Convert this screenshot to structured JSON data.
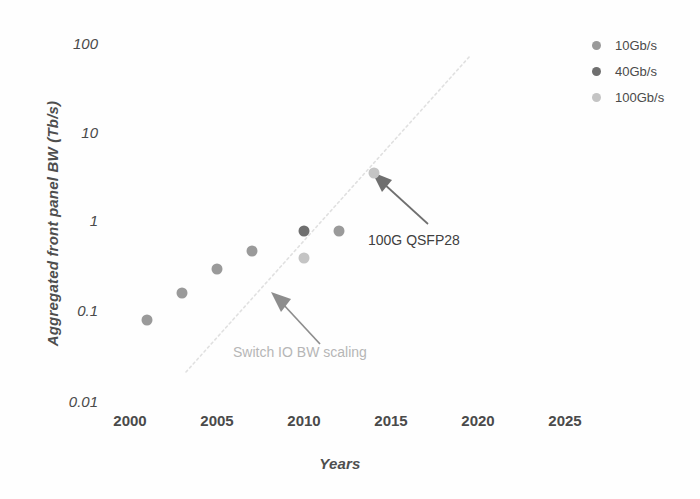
{
  "chart_data": {
    "type": "scatter",
    "title": "",
    "xlabel": "Years",
    "ylabel": "Aggregated front panel BW (Tb/s)",
    "yscale": "log",
    "ylim": [
      0.01,
      100
    ],
    "xlim": [
      2000,
      2025
    ],
    "grid": false,
    "legend_position": "top-right",
    "xticks": [
      "2000",
      "2005",
      "2010",
      "2015",
      "2020",
      "2025"
    ],
    "xtick_values": [
      2000,
      2005,
      2010,
      2015,
      2020,
      2025
    ],
    "yticks": [
      "100",
      "10",
      "1",
      "0.1",
      "0.01"
    ],
    "ytick_values": [
      100,
      10,
      1,
      0.1,
      0.01
    ],
    "series": [
      {
        "name": "10Gb/s",
        "color": "#9a9a9a",
        "points": [
          {
            "x": 2001,
            "y": 0.08
          },
          {
            "x": 2003,
            "y": 0.16
          },
          {
            "x": 2005,
            "y": 0.3
          },
          {
            "x": 2007,
            "y": 0.47
          },
          {
            "x": 2012,
            "y": 0.8
          }
        ]
      },
      {
        "name": "40Gb/s",
        "color": "#6f6f6f",
        "points": [
          {
            "x": 2010,
            "y": 0.8
          }
        ]
      },
      {
        "name": "100Gb/s",
        "color": "#c4c4c4",
        "points": [
          {
            "x": 2010,
            "y": 0.4
          },
          {
            "x": 2014,
            "y": 3.5
          }
        ]
      }
    ],
    "trend_line": {
      "name": "Switch IO BW scaling",
      "style": "dotted",
      "color": "#dcdcdc",
      "from": {
        "x": 2003.2,
        "y": 0.022
      },
      "to": {
        "x": 2019.5,
        "y": 60
      }
    },
    "annotations": [
      {
        "id": "qsfp",
        "text": "100G QSFP28",
        "color": "#3f3f3f",
        "arrow_from": {
          "x": 2015.8,
          "y": 1.55
        },
        "arrow_to": {
          "x": 2014.3,
          "y": 3.1
        }
      },
      {
        "id": "switch-scaling",
        "text": "Switch IO BW scaling",
        "color": "#b6b6b6",
        "arrow_from": {
          "x": 2011.0,
          "y": 0.082
        },
        "arrow_to": {
          "x": 2009.1,
          "y": 0.185
        }
      }
    ]
  },
  "axes": {
    "y_title": "Aggregated front panel BW (Tb/s)",
    "x_title": "Years",
    "y_ticks": [
      {
        "label": "100"
      },
      {
        "label": "10"
      },
      {
        "label": "1"
      },
      {
        "label": "0.1"
      },
      {
        "label": "0.01"
      }
    ],
    "x_ticks": [
      {
        "label": "2000"
      },
      {
        "label": "2005"
      },
      {
        "label": "2010"
      },
      {
        "label": "2015"
      },
      {
        "label": "2020"
      },
      {
        "label": "2025"
      }
    ]
  },
  "legend": {
    "items": [
      {
        "label": "10Gb/s",
        "color": "#9a9a9a"
      },
      {
        "label": "40Gb/s",
        "color": "#6f6f6f"
      },
      {
        "label": "100Gb/s",
        "color": "#c4c4c4"
      }
    ]
  },
  "annotations": {
    "qsfp_label": "100G QSFP28",
    "switch_label": "Switch IO BW scaling"
  },
  "colors": {
    "series_10g": "#9a9a9a",
    "series_40g": "#6f6f6f",
    "series_100g": "#c4c4c4",
    "trend": "#dcdcdc",
    "arrow_dark": "#6b6b6b",
    "arrow_light": "#b0b0b0",
    "text": "#4a4a4a",
    "background": "#fefefe"
  }
}
